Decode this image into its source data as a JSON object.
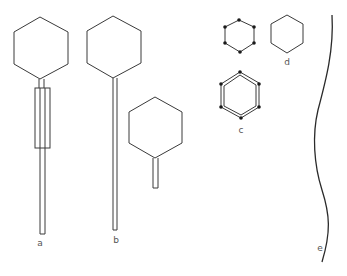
{
  "figure": {
    "background": "#ffffff",
    "line_color": "#3a3a3a",
    "label_color": "#555555",
    "panels": [
      {
        "id": "a",
        "label": "a",
        "description": "phage with hexagonal head, neck, contractile sheath and long tail tube"
      },
      {
        "id": "b",
        "label": "b",
        "description": "phage with hexagonal head and long thin non-contractile tail"
      },
      {
        "id": "short-tail",
        "label": "",
        "description": "phage with hexagonal head and short tail"
      },
      {
        "id": "dotted-hexagon",
        "label": "",
        "description": "hexagon with dots at vertices"
      },
      {
        "id": "c",
        "label": "c",
        "description": "double-outlined hexagon with dots at vertices"
      },
      {
        "id": "d",
        "label": "d",
        "description": "plain hexagon"
      },
      {
        "id": "e",
        "label": "e",
        "description": "long wavy filament"
      }
    ]
  }
}
